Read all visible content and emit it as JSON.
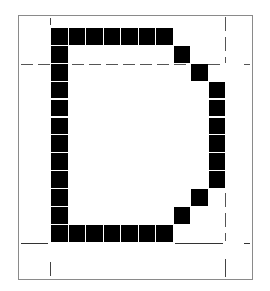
{
  "figure": {
    "letter": "D",
    "colors": {
      "pixel": "#000000",
      "background": "#ffffff",
      "frame": "#8a8a8a",
      "guide": "#555555"
    },
    "grid": {
      "columns": 10,
      "rows": 12,
      "origin_x": 51,
      "origin_y": 28,
      "cell_w": 17.5,
      "cell_h": 17.9
    },
    "filled_cells": [
      [
        0,
        0
      ],
      [
        1,
        0
      ],
      [
        2,
        0
      ],
      [
        3,
        0
      ],
      [
        4,
        0
      ],
      [
        5,
        0
      ],
      [
        6,
        0
      ],
      [
        0,
        1
      ],
      [
        7,
        1
      ],
      [
        0,
        2
      ],
      [
        8,
        2
      ],
      [
        0,
        3
      ],
      [
        9,
        3
      ],
      [
        0,
        4
      ],
      [
        9,
        4
      ],
      [
        0,
        5
      ],
      [
        9,
        5
      ],
      [
        0,
        6
      ],
      [
        9,
        6
      ],
      [
        0,
        7
      ],
      [
        9,
        7
      ],
      [
        0,
        8
      ],
      [
        9,
        8
      ],
      [
        0,
        9
      ],
      [
        8,
        9
      ],
      [
        0,
        10
      ],
      [
        7,
        10
      ],
      [
        0,
        11
      ],
      [
        1,
        11
      ],
      [
        2,
        11
      ],
      [
        3,
        11
      ],
      [
        4,
        11
      ],
      [
        5,
        11
      ],
      [
        6,
        11
      ]
    ],
    "guides": {
      "x_height_line_y": 64,
      "baseline_y": 243,
      "left_guide_x": 50,
      "right_guide_x": 225
    }
  }
}
